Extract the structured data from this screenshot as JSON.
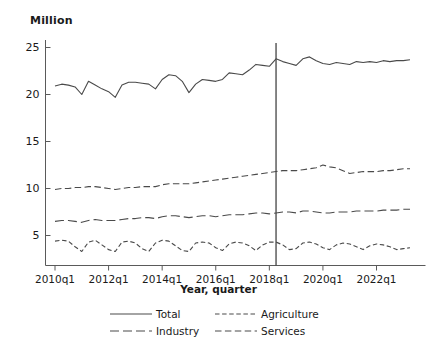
{
  "chart_data": {
    "type": "line",
    "title": "",
    "ylabel": "Million",
    "xlabel": "Year, quarter",
    "ylim": [
      0,
      26.5
    ],
    "yticks": [
      5,
      10,
      15,
      20,
      25
    ],
    "xticks": [
      "2010q1",
      "2012q1",
      "2014q1",
      "2016q1",
      "2018q1",
      "2020q1",
      "2022q1"
    ],
    "xlim": [
      "2010q1",
      "2023q2"
    ],
    "grid": false,
    "legend_position": "bottom",
    "reference_line": {
      "at": "2018q2",
      "orientation": "vertical",
      "color": "#444444"
    },
    "line_color": "#4a4a4a",
    "x": [
      "2010q1",
      "2010q2",
      "2010q3",
      "2010q4",
      "2011q1",
      "2011q2",
      "2011q3",
      "2011q4",
      "2012q1",
      "2012q2",
      "2012q3",
      "2012q4",
      "2013q1",
      "2013q2",
      "2013q3",
      "2013q4",
      "2014q1",
      "2014q2",
      "2014q3",
      "2014q4",
      "2015q1",
      "2015q2",
      "2015q3",
      "2015q4",
      "2016q1",
      "2016q2",
      "2016q3",
      "2016q4",
      "2017q1",
      "2017q2",
      "2017q3",
      "2017q4",
      "2018q1",
      "2018q2",
      "2018q3",
      "2018q4",
      "2019q1",
      "2019q2",
      "2019q3",
      "2019q4",
      "2020q1",
      "2020q2",
      "2020q3",
      "2020q4",
      "2021q1",
      "2021q2",
      "2021q3",
      "2021q4",
      "2022q1",
      "2022q2",
      "2022q3",
      "2022q4",
      "2023q1",
      "2023q2"
    ],
    "series": [
      {
        "name": "Total",
        "dash": "solid",
        "values": [
          20.9,
          21.1,
          21.0,
          20.8,
          20.0,
          21.4,
          21.0,
          20.6,
          20.3,
          19.7,
          21.0,
          21.3,
          21.3,
          21.2,
          21.1,
          20.6,
          21.6,
          22.1,
          22.0,
          21.4,
          20.2,
          21.1,
          21.6,
          21.5,
          21.4,
          21.6,
          22.3,
          22.2,
          22.1,
          22.6,
          23.2,
          23.1,
          23.0,
          23.8,
          23.5,
          23.3,
          23.1,
          23.8,
          24.0,
          23.6,
          23.3,
          23.2,
          23.4,
          23.3,
          23.2,
          23.5,
          23.4,
          23.5,
          23.4,
          23.6,
          23.5,
          23.6,
          23.6,
          23.7
        ]
      },
      {
        "name": "Agriculture",
        "dash": "short",
        "values": [
          4.4,
          4.5,
          4.4,
          3.8,
          3.3,
          4.3,
          4.5,
          4.0,
          3.5,
          3.3,
          4.3,
          4.4,
          4.2,
          3.6,
          3.3,
          4.2,
          4.5,
          4.4,
          3.9,
          3.4,
          3.3,
          4.2,
          4.3,
          4.2,
          3.7,
          3.4,
          4.1,
          4.3,
          4.2,
          3.9,
          3.4,
          4.0,
          4.3,
          4.3,
          4.0,
          3.5,
          3.6,
          4.2,
          4.3,
          4.1,
          3.7,
          3.5,
          4.0,
          4.2,
          4.1,
          3.8,
          3.5,
          3.9,
          4.1,
          4.0,
          3.8,
          3.5,
          3.6,
          3.7
        ]
      },
      {
        "name": "Industry",
        "dash": "long",
        "values": [
          6.5,
          6.6,
          6.6,
          6.5,
          6.4,
          6.6,
          6.7,
          6.6,
          6.6,
          6.6,
          6.7,
          6.8,
          6.8,
          6.9,
          6.9,
          6.8,
          7.0,
          7.1,
          7.1,
          7.0,
          6.9,
          7.0,
          7.1,
          7.1,
          7.0,
          7.1,
          7.2,
          7.2,
          7.2,
          7.3,
          7.4,
          7.4,
          7.3,
          7.4,
          7.5,
          7.5,
          7.4,
          7.6,
          7.6,
          7.5,
          7.4,
          7.4,
          7.5,
          7.5,
          7.5,
          7.6,
          7.6,
          7.6,
          7.6,
          7.7,
          7.7,
          7.7,
          7.8,
          7.8
        ]
      },
      {
        "name": "Services",
        "dash": "medium",
        "values": [
          9.9,
          10.0,
          10.0,
          10.1,
          10.1,
          10.2,
          10.2,
          10.1,
          10.0,
          9.9,
          10.0,
          10.1,
          10.1,
          10.2,
          10.2,
          10.2,
          10.4,
          10.5,
          10.5,
          10.5,
          10.5,
          10.6,
          10.7,
          10.8,
          10.9,
          11.0,
          11.1,
          11.2,
          11.3,
          11.4,
          11.5,
          11.6,
          11.7,
          11.8,
          11.9,
          11.9,
          11.9,
          12.0,
          12.1,
          12.2,
          12.5,
          12.3,
          12.2,
          11.9,
          11.6,
          11.7,
          11.8,
          11.8,
          11.8,
          11.9,
          11.9,
          12.0,
          12.1,
          12.1
        ]
      }
    ]
  }
}
